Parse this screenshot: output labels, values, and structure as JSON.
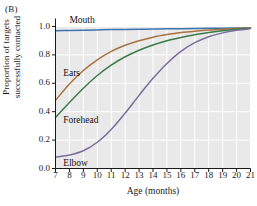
{
  "figure": {
    "panel_label": "(B)",
    "background_color": "#ffffff",
    "plot_background_color": "#e9e9e9",
    "gridline_color": "#ffffff",
    "axis_color": "#1a1a1a"
  },
  "chart_data": {
    "type": "line",
    "title": "",
    "xlabel": "Age (months)",
    "ylabel": "Proportion of targets successfully contacted",
    "ylabel_line1": "Proportion of targets",
    "ylabel_line2": "successfully contacted",
    "xlim": [
      7,
      21
    ],
    "ylim": [
      0.0,
      1.0
    ],
    "grid": true,
    "legend_position": "inline-labels",
    "xticks": [
      7,
      8,
      9,
      10,
      11,
      12,
      13,
      14,
      15,
      16,
      17,
      18,
      19,
      20,
      21
    ],
    "xtick_labels": [
      "7",
      "8",
      "9",
      "10",
      "11",
      "12",
      "13",
      "14",
      "15",
      "16",
      "17",
      "18",
      "19",
      "20",
      "21"
    ],
    "yticks": [
      0.0,
      0.2,
      0.4,
      0.6,
      0.8,
      1.0
    ],
    "ytick_labels": [
      "0.0",
      "0.2",
      "0.4",
      "0.6",
      "0.8",
      "1.0"
    ],
    "x": [
      7,
      8,
      9,
      10,
      11,
      12,
      13,
      14,
      15,
      16,
      17,
      18,
      19,
      20,
      21
    ],
    "series": [
      {
        "name": "Mouth",
        "color": "#3b74b0",
        "label_x": 8.0,
        "label_y": 1.04,
        "values": [
          0.97,
          0.972,
          0.974,
          0.976,
          0.978,
          0.979,
          0.981,
          0.982,
          0.984,
          0.985,
          0.986,
          0.987,
          0.988,
          0.989,
          0.99
        ]
      },
      {
        "name": "Ears",
        "color": "#a9713f",
        "label_x": 7.55,
        "label_y": 0.665,
        "values": [
          0.48,
          0.595,
          0.69,
          0.765,
          0.825,
          0.868,
          0.9,
          0.925,
          0.943,
          0.957,
          0.967,
          0.975,
          0.981,
          0.986,
          0.99
        ]
      },
      {
        "name": "Forehead",
        "color": "#3d7a4a",
        "label_x": 7.55,
        "label_y": 0.335,
        "values": [
          0.36,
          0.465,
          0.565,
          0.655,
          0.728,
          0.787,
          0.833,
          0.87,
          0.9,
          0.923,
          0.942,
          0.957,
          0.97,
          0.98,
          0.988
        ]
      },
      {
        "name": "Elbow",
        "color": "#7a6d9e",
        "label_x": 7.55,
        "label_y": 0.035,
        "values": [
          0.08,
          0.095,
          0.125,
          0.185,
          0.275,
          0.39,
          0.515,
          0.635,
          0.74,
          0.825,
          0.886,
          0.928,
          0.955,
          0.973,
          0.985
        ]
      }
    ]
  }
}
